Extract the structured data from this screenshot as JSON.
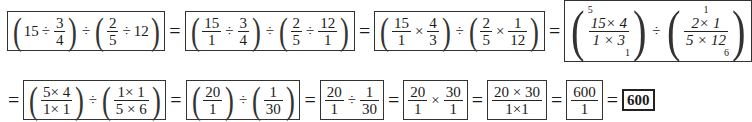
{
  "row1": {
    "step1": {
      "a": "15",
      "op1": "÷",
      "f1n": "3",
      "f1d": "4",
      "op2": "÷",
      "f2n": "2",
      "f2d": "5",
      "op3": "÷",
      "b": "12"
    },
    "eq": "=",
    "step2": {
      "f1n": "15",
      "f1d": "1",
      "op1": "÷",
      "f2n": "3",
      "f2d": "4",
      "op2": "÷",
      "f3n": "2",
      "f3d": "5",
      "op3": "÷",
      "f4n": "12",
      "f4d": "1"
    },
    "step3": {
      "f1n": "15",
      "f1d": "1",
      "op1": "×",
      "f2n": "4",
      "f2d": "3",
      "op2": "÷",
      "f3n": "2",
      "f3d": "5",
      "op3": "×",
      "f4n": "1",
      "f4d": "12"
    },
    "step4": {
      "left": {
        "top_cancel": "5",
        "num": "15× 4",
        "den": "1 × 3",
        "bottom_cancel": "1"
      },
      "op": "÷",
      "right": {
        "top_cancel": "1",
        "num": "2× 1",
        "den": "5 × 12",
        "bottom_cancel": "6"
      }
    }
  },
  "row2": {
    "eq": "=",
    "step5": {
      "f1n": "5× 4",
      "f1d": "1× 1",
      "op": "÷",
      "f2n": "1× 1",
      "f2d": "5 × 6"
    },
    "step6": {
      "f1n": "20",
      "f1d": "1",
      "op": "÷",
      "f2n": "1",
      "f2d": "30"
    },
    "step7": {
      "f1n": "20",
      "f1d": "1",
      "op": "÷",
      "f2n": "1",
      "f2d": "30"
    },
    "step8": {
      "f1n": "20",
      "f1d": "1",
      "op": "×",
      "f2n": "30",
      "f2d": "1"
    },
    "step9": {
      "n": "20 × 30",
      "d": "1×1"
    },
    "step10": {
      "n": "600",
      "d": "1"
    },
    "answer": "600"
  }
}
